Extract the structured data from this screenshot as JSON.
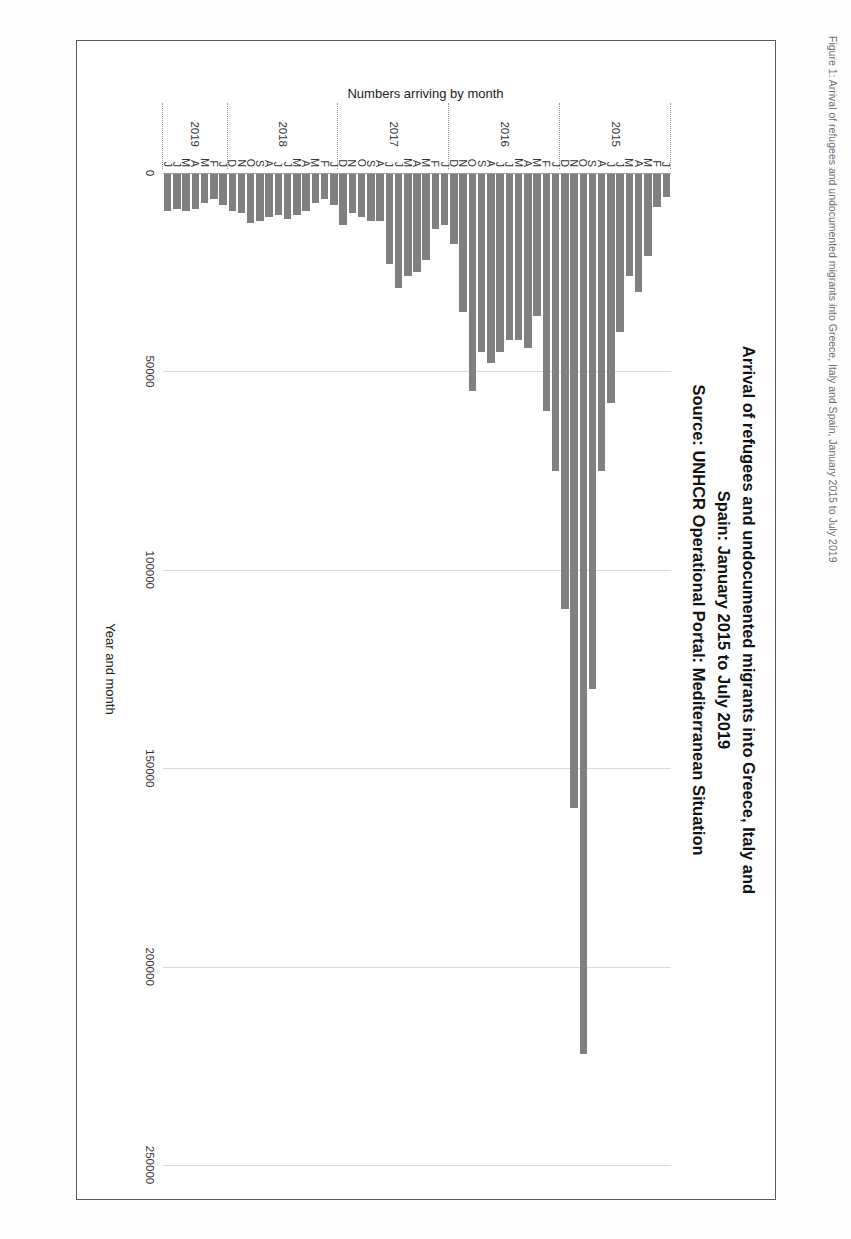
{
  "chart_data": {
    "type": "bar",
    "orientation": "vertical",
    "title": "Arrival of refugees and undocumented migrants into Greece, Italy and\nSpain: January 2015 to July 2019\nSource: UNHCR Operational Portal: Mediterranean Situation",
    "title_lines": [
      "Arrival of refugees and undocumented migrants into Greece, Italy and",
      "Spain: January 2015 to July 2019",
      "Source: UNHCR Operational Portal: Mediterranean Situation"
    ],
    "xlabel": "Year and month",
    "ylabel": "Numbers arriving by month",
    "ylim": [
      0,
      250000
    ],
    "yticks": [
      0,
      50000,
      100000,
      150000,
      200000,
      250000
    ],
    "ytick_labels": [
      "0",
      "50000",
      "100000",
      "150000",
      "200000",
      "250000"
    ],
    "grid": true,
    "legend": "none",
    "bar_color": "#808080",
    "years": [
      {
        "label": "2015",
        "start_index": 0,
        "count": 12
      },
      {
        "label": "2016",
        "start_index": 12,
        "count": 12
      },
      {
        "label": "2017",
        "start_index": 24,
        "count": 12
      },
      {
        "label": "2018",
        "start_index": 36,
        "count": 12
      },
      {
        "label": "2019",
        "start_index": 48,
        "count": 7
      }
    ],
    "categories": [
      "J",
      "F",
      "M",
      "A",
      "M",
      "J",
      "J",
      "A",
      "S",
      "O",
      "N",
      "D",
      "J",
      "F",
      "M",
      "A",
      "M",
      "J",
      "J",
      "A",
      "S",
      "O",
      "N",
      "D",
      "J",
      "F",
      "M",
      "A",
      "M",
      "J",
      "J",
      "A",
      "S",
      "O",
      "N",
      "D",
      "J",
      "F",
      "M",
      "A",
      "M",
      "J",
      "J",
      "A",
      "S",
      "O",
      "N",
      "D",
      "J",
      "F",
      "M",
      "A",
      "M",
      "J",
      "J"
    ],
    "values": [
      6000,
      8500,
      21000,
      30000,
      26000,
      40000,
      58000,
      75000,
      130000,
      222000,
      160000,
      110000,
      75000,
      60000,
      36000,
      44000,
      42000,
      42000,
      45000,
      48000,
      45000,
      55000,
      35000,
      18000,
      13000,
      14000,
      22000,
      25000,
      26000,
      29000,
      23000,
      12000,
      12000,
      11000,
      10000,
      13000,
      8000,
      6500,
      7500,
      9500,
      10500,
      11500,
      10500,
      11000,
      12000,
      12500,
      10000,
      9500,
      8000,
      6500,
      7500,
      9000,
      9500,
      9000,
      9500
    ],
    "units": "persons per month"
  },
  "caption": {
    "text": "Figure 1: Arrival of refugees and undocumented migrants into Greece, Italy and Spain, January 2015 to July 2019"
  }
}
